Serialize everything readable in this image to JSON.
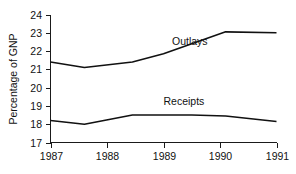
{
  "chart_data": {
    "type": "line",
    "title": "",
    "xlabel": "",
    "ylabel": "Percentage of GNP",
    "xlim": [
      1987,
      1991
    ],
    "ylim": [
      17,
      24
    ],
    "grid": false,
    "legend_position": "inline-annotation",
    "y_ticks": [
      17,
      18,
      19,
      20,
      21,
      22,
      23,
      24
    ],
    "y_tick_labels": [
      "17",
      "18",
      "19",
      "20",
      "21",
      "22",
      "23",
      "24"
    ],
    "x_ticks": [
      1987,
      1988,
      1989,
      1990,
      1991
    ],
    "x_tick_labels": [
      "1987",
      "1988",
      "1989",
      "1990",
      "1991"
    ],
    "series": [
      {
        "name": "Outlays",
        "label_x": 1989.15,
        "label_y": 22.35,
        "x": [
          1987.0,
          1987.6,
          1988.45,
          1989.0,
          1990.1,
          1991.0
        ],
        "values": [
          21.4,
          21.1,
          21.4,
          21.85,
          23.05,
          23.0
        ]
      },
      {
        "name": "Receipts",
        "label_x": 1989.0,
        "label_y": 19.05,
        "x": [
          1987.0,
          1987.6,
          1988.45,
          1989.5,
          1990.1,
          1991.0
        ],
        "values": [
          18.2,
          18.0,
          18.5,
          18.5,
          18.45,
          18.15
        ]
      }
    ],
    "colors": {
      "line": "#111111",
      "axis": "#1a1a1a",
      "text": "#111111",
      "background": "#ffffff"
    }
  }
}
